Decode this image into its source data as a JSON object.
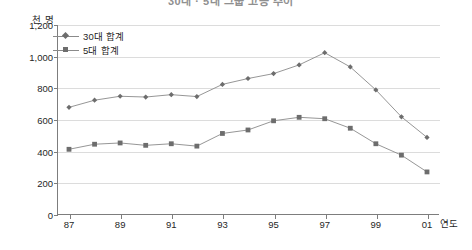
{
  "title": {
    "text": "30대 · 5대 그룹 고용 추이",
    "visible_partially": true
  },
  "unit_label": "천 명",
  "xaxis_title": "연도",
  "yaxis_ticklabels": [
    "0",
    "200",
    "400",
    "600",
    "800",
    "1,000",
    "1,200"
  ],
  "xaxis_ticklabels": [
    "87",
    "89",
    "91",
    "93",
    "95",
    "97",
    "99",
    "01"
  ],
  "legend": {
    "position": "top-left-inside",
    "items": [
      {
        "label": "30대 합계",
        "marker": "diamond-icon",
        "color": "#6d6d6d"
      },
      {
        "label": "5대 합계",
        "marker": "square-icon",
        "color": "#6d6d6d"
      }
    ]
  },
  "colors": {
    "line": "#8a8a8a",
    "marker": "#6d6d6d",
    "grid": "#dcdcdc",
    "axis": "#7d7d7d",
    "text": "#1f1f1f",
    "background": "#ffffff"
  },
  "chart_data": {
    "type": "line",
    "title": "30대 · 5대 그룹 고용 추이",
    "xlabel": "연도",
    "ylabel": "천 명",
    "ylim": [
      0,
      1200
    ],
    "yticks": [
      0,
      200,
      400,
      600,
      800,
      1000,
      1200
    ],
    "grid": true,
    "x": [
      "87",
      "88",
      "89",
      "90",
      "91",
      "92",
      "93",
      "94",
      "95",
      "96",
      "97",
      "98",
      "99",
      "00",
      "01"
    ],
    "xtick_labels_shown": [
      "87",
      "89",
      "91",
      "93",
      "95",
      "97",
      "99",
      "01"
    ],
    "series": [
      {
        "name": "30대 합계",
        "marker": "diamond",
        "values": [
          680,
          725,
          750,
          745,
          760,
          748,
          825,
          862,
          893,
          948,
          1025,
          935,
          790,
          620,
          490
        ]
      },
      {
        "name": "5대 합계",
        "marker": "square",
        "values": [
          415,
          447,
          455,
          440,
          450,
          435,
          515,
          537,
          595,
          617,
          608,
          548,
          450,
          378,
          272
        ]
      }
    ]
  }
}
